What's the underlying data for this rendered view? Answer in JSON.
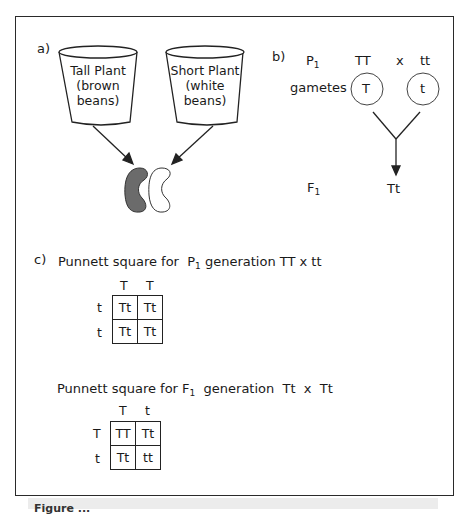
{
  "figure": {
    "caption_partial": "Figure ..."
  },
  "part_a": {
    "label": "a)",
    "cups": [
      {
        "line1": "Tall Plant",
        "line2": "(brown",
        "line3": "beans)"
      },
      {
        "line1": "Short Plant",
        "line2": "(white",
        "line3": "beans)"
      }
    ],
    "beans": [
      {
        "name": "brown-bean",
        "fill": "#6b6b6b"
      },
      {
        "name": "white-bean",
        "fill": "#ffffff"
      }
    ]
  },
  "part_b": {
    "label": "b)",
    "p1_label": "P",
    "p1_sub": "1",
    "parent1": "TT",
    "cross_symbol": "x",
    "parent2": "tt",
    "gametes_label": "gametes",
    "gamete1": "T",
    "gamete2": "t",
    "f1_label": "F",
    "f1_sub": "1",
    "offspring": "Tt"
  },
  "part_c": {
    "label": "c)",
    "square1": {
      "title_pre": "Punnett square for  P",
      "title_sub": "1",
      "title_post": " generation TT x tt",
      "col_headers": [
        "T",
        "T"
      ],
      "row_headers": [
        "t",
        "t"
      ],
      "cells": [
        [
          "Tt",
          "Tt"
        ],
        [
          "Tt",
          "Tt"
        ]
      ]
    },
    "square2": {
      "title_pre": "Punnett square for F",
      "title_sub": "1",
      "title_post": "  generation  Tt  x  Tt",
      "col_headers": [
        "T",
        "t"
      ],
      "row_headers": [
        "T",
        "t"
      ],
      "cells": [
        [
          "TT",
          "Tt"
        ],
        [
          "Tt",
          "tt"
        ]
      ]
    }
  },
  "colors": {
    "line": "#222222",
    "brown_bean": "#6b6b6b",
    "caption_band": "#ececec"
  }
}
